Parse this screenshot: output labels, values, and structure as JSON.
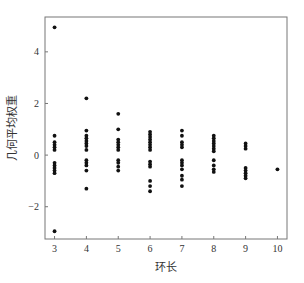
{
  "chart_data": {
    "type": "scatter",
    "title": "",
    "xlabel": "环长",
    "ylabel": "几何平均权重",
    "xlim": [
      2.7,
      10.3
    ],
    "ylim": [
      -3.25,
      5.35
    ],
    "xticks": [
      3,
      4,
      5,
      6,
      7,
      8,
      9,
      10
    ],
    "yticks": [
      -2,
      0,
      2,
      4
    ],
    "grid": false,
    "legend": null,
    "marker_color": "#111111",
    "series": [
      {
        "name": "几何平均权重",
        "points": [
          {
            "x": 3,
            "y": 4.95
          },
          {
            "x": 3,
            "y": 0.75
          },
          {
            "x": 3,
            "y": 0.5
          },
          {
            "x": 3,
            "y": 0.4
          },
          {
            "x": 3,
            "y": 0.3
          },
          {
            "x": 3,
            "y": 0.2
          },
          {
            "x": 3,
            "y": -0.3
          },
          {
            "x": 3,
            "y": -0.4
          },
          {
            "x": 3,
            "y": -0.5
          },
          {
            "x": 3,
            "y": -0.6
          },
          {
            "x": 3,
            "y": -0.7
          },
          {
            "x": 3,
            "y": -2.95
          },
          {
            "x": 4,
            "y": 2.2
          },
          {
            "x": 4,
            "y": 0.95
          },
          {
            "x": 4,
            "y": 0.75
          },
          {
            "x": 4,
            "y": 0.65
          },
          {
            "x": 4,
            "y": 0.55
          },
          {
            "x": 4,
            "y": 0.45
          },
          {
            "x": 4,
            "y": 0.35
          },
          {
            "x": 4,
            "y": 0.2
          },
          {
            "x": 4,
            "y": -0.2
          },
          {
            "x": 4,
            "y": -0.3
          },
          {
            "x": 4,
            "y": -0.4
          },
          {
            "x": 4,
            "y": -0.6
          },
          {
            "x": 4,
            "y": -1.3
          },
          {
            "x": 5,
            "y": 1.6
          },
          {
            "x": 5,
            "y": 1.0
          },
          {
            "x": 5,
            "y": 0.6
          },
          {
            "x": 5,
            "y": 0.5
          },
          {
            "x": 5,
            "y": 0.4
          },
          {
            "x": 5,
            "y": 0.3
          },
          {
            "x": 5,
            "y": 0.2
          },
          {
            "x": 5,
            "y": -0.2
          },
          {
            "x": 5,
            "y": -0.3
          },
          {
            "x": 5,
            "y": -0.45
          },
          {
            "x": 5,
            "y": -0.6
          },
          {
            "x": 6,
            "y": 0.9
          },
          {
            "x": 6,
            "y": 0.8
          },
          {
            "x": 6,
            "y": 0.7
          },
          {
            "x": 6,
            "y": 0.6
          },
          {
            "x": 6,
            "y": 0.5
          },
          {
            "x": 6,
            "y": 0.4
          },
          {
            "x": 6,
            "y": 0.3
          },
          {
            "x": 6,
            "y": 0.2
          },
          {
            "x": 6,
            "y": -0.25
          },
          {
            "x": 6,
            "y": -0.35
          },
          {
            "x": 6,
            "y": -0.45
          },
          {
            "x": 6,
            "y": -1.0
          },
          {
            "x": 6,
            "y": -1.2
          },
          {
            "x": 6,
            "y": -1.4
          },
          {
            "x": 7,
            "y": 0.95
          },
          {
            "x": 7,
            "y": 0.75
          },
          {
            "x": 7,
            "y": 0.5
          },
          {
            "x": 7,
            "y": 0.4
          },
          {
            "x": 7,
            "y": 0.3
          },
          {
            "x": 7,
            "y": -0.2
          },
          {
            "x": 7,
            "y": -0.3
          },
          {
            "x": 7,
            "y": -0.4
          },
          {
            "x": 7,
            "y": -0.55
          },
          {
            "x": 7,
            "y": -0.8
          },
          {
            "x": 7,
            "y": -0.95
          },
          {
            "x": 7,
            "y": -1.2
          },
          {
            "x": 8,
            "y": 0.75
          },
          {
            "x": 8,
            "y": 0.65
          },
          {
            "x": 8,
            "y": 0.55
          },
          {
            "x": 8,
            "y": 0.45
          },
          {
            "x": 8,
            "y": 0.35
          },
          {
            "x": 8,
            "y": 0.25
          },
          {
            "x": 8,
            "y": 0.15
          },
          {
            "x": 8,
            "y": -0.2
          },
          {
            "x": 8,
            "y": -0.4
          },
          {
            "x": 8,
            "y": -0.55
          },
          {
            "x": 8,
            "y": -0.65
          },
          {
            "x": 9,
            "y": 0.45
          },
          {
            "x": 9,
            "y": 0.35
          },
          {
            "x": 9,
            "y": 0.25
          },
          {
            "x": 9,
            "y": -0.5
          },
          {
            "x": 9,
            "y": -0.6
          },
          {
            "x": 9,
            "y": -0.7
          },
          {
            "x": 9,
            "y": -0.8
          },
          {
            "x": 9,
            "y": -0.9
          },
          {
            "x": 10,
            "y": -0.55
          }
        ]
      }
    ]
  },
  "axes": {
    "xlabel": "环长",
    "ylabel": "几何平均权重",
    "xtick_labels": [
      "3",
      "4",
      "5",
      "6",
      "7",
      "8",
      "9",
      "10"
    ],
    "ytick_labels": [
      "-2",
      "0",
      "2",
      "4"
    ]
  }
}
